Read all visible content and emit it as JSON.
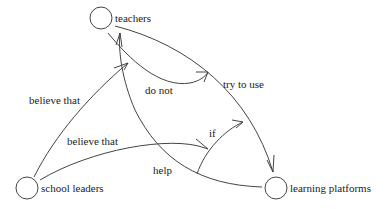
{
  "nodes": {
    "teachers": {
      "label": "teachers"
    },
    "school_leaders": {
      "label": "school leaders"
    },
    "learning_platforms": {
      "label": "learning platforms"
    }
  },
  "edges": {
    "believe_that_1": {
      "label": "believe that",
      "from": "school leaders",
      "to": "do not"
    },
    "believe_that_2": {
      "label": "believe that",
      "from": "school leaders",
      "to": "if"
    },
    "do_not": {
      "label": "do not",
      "from": "teachers",
      "to": "try to use"
    },
    "try_to_use": {
      "label": "try to use",
      "from": "teachers",
      "to": "learning platforms"
    },
    "if": {
      "label": "if",
      "from": "help",
      "to": "try to use"
    },
    "help": {
      "label": "help",
      "from": "learning platforms",
      "to": "teachers"
    }
  }
}
